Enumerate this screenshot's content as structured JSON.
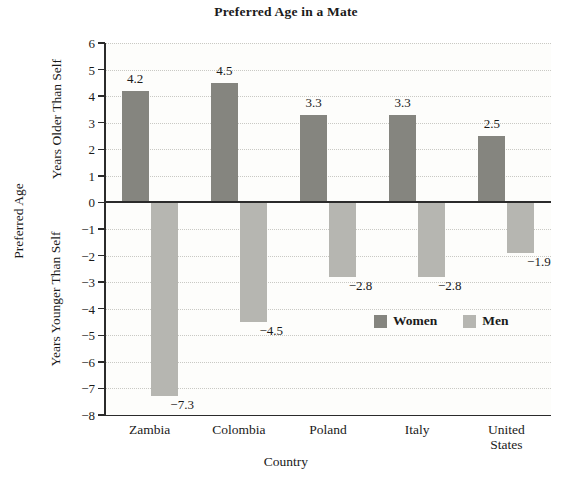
{
  "chart_data": {
    "type": "bar",
    "title": "Preferred Age in a Mate",
    "xlabel": "Country",
    "ylabel": "Preferred Age",
    "ylabel_upper": "Years Older Than Self",
    "ylabel_lower": "Years Younger Than Self",
    "categories": [
      "Zambia",
      "Colombia",
      "Poland",
      "Italy",
      "United\nStates"
    ],
    "series": [
      {
        "name": "Women",
        "color": "#85857f",
        "values": [
          4.2,
          4.5,
          3.3,
          3.3,
          2.5
        ],
        "labels": [
          "4.2",
          "4.5",
          "3.3",
          "3.3",
          "2.5"
        ]
      },
      {
        "name": "Men",
        "color": "#b6b6b1",
        "values": [
          -7.3,
          -4.5,
          -2.8,
          -2.8,
          -1.9
        ],
        "labels": [
          "−7.3",
          "−4.5",
          "−2.8",
          "−2.8",
          "−1.9"
        ]
      }
    ],
    "ylim": [
      -8,
      6
    ],
    "yticks": [
      6,
      5,
      4,
      3,
      2,
      1,
      0,
      -1,
      -2,
      -3,
      -4,
      -5,
      -6,
      -7,
      -8
    ],
    "ytick_labels": [
      "6",
      "5",
      "4",
      "3",
      "2",
      "1",
      "0",
      "−1",
      "−2",
      "−3",
      "−4",
      "−5",
      "−6",
      "−7",
      "−8"
    ],
    "grid": true,
    "legend_position": "inside-lower-right",
    "legend": [
      "Women",
      "Men"
    ]
  }
}
